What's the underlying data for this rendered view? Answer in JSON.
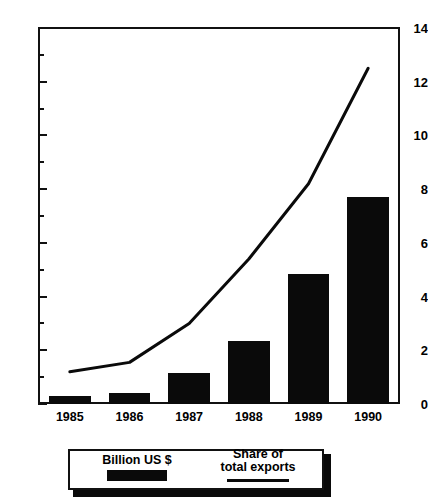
{
  "chart_data": {
    "type": "bar",
    "title": "",
    "subtitle": "",
    "xlabel": "",
    "ylabel": "",
    "categories": [
      "1985",
      "1986",
      "1987",
      "1988",
      "1989",
      "1990"
    ],
    "ylim": [
      0,
      14
    ],
    "ytick_major": [
      0,
      2,
      4,
      6,
      8,
      10,
      12,
      14
    ],
    "ytick_minor": [
      1,
      3,
      5,
      7,
      9,
      11,
      13
    ],
    "ytick_labels": [
      "0",
      "2",
      "4",
      "6",
      "8",
      "10",
      "12",
      "14"
    ],
    "grid": false,
    "legend_position": "bottom",
    "series": [
      {
        "name": "Billion US $",
        "type": "bar",
        "color": "#0a0a0a",
        "values": [
          0.3,
          0.4,
          1.15,
          2.35,
          4.85,
          7.7
        ]
      },
      {
        "name": "Share of total exports",
        "type": "line",
        "color": "#0a0a0a",
        "values": [
          1.2,
          1.55,
          3.0,
          5.4,
          8.2,
          12.5
        ]
      }
    ]
  },
  "axis": {
    "y_labels": [
      "14",
      "12",
      "10",
      "8",
      "6",
      "4",
      "2",
      "0"
    ],
    "x_labels": [
      "1985",
      "1986",
      "1987",
      "1988",
      "1989",
      "1990"
    ]
  },
  "legend": {
    "bars_label": "Billion US $",
    "line_label": "Share of\ntotal exports"
  }
}
